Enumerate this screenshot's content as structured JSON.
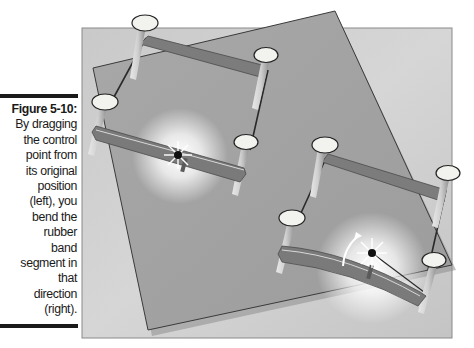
{
  "caption": {
    "label": "Figure 5-10:",
    "lines": [
      "By dragging",
      "the control",
      "point from",
      "its original",
      "position",
      "(left), you",
      "bend the",
      "rubber",
      "band",
      "segment in",
      "that",
      "direction",
      "(right)."
    ]
  },
  "figure": {
    "panels": [
      {
        "name": "left",
        "state": "original",
        "band": "straight"
      },
      {
        "name": "right",
        "state": "dragged",
        "band": "bent"
      }
    ],
    "colors": {
      "background_square": "#bdbdbd",
      "rotated_square": "#9f9f9f",
      "band": "#7c7c7c",
      "nail_head": "#f2f2ee",
      "control_point": "#111111",
      "glow": "#ffffff"
    }
  }
}
